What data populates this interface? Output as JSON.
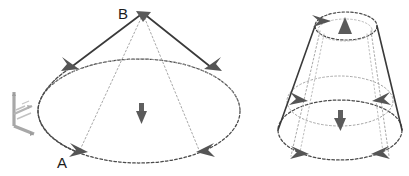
{
  "figure": {
    "background_color": "#ffffff",
    "solid_edge_color": "#3a3a3a",
    "hidden_edge_color": "#9a9a9a",
    "outline_color": "#4a4a4a",
    "arrow_color": "#555555",
    "axis_triad_color": "#9d9d9d",
    "label_color": "#1c1c1c"
  },
  "labels": {
    "apex": "B",
    "base_point": "A"
  },
  "axis_triad": {
    "name": "coordinate-triad",
    "axes": [
      "z",
      "x",
      "y"
    ]
  },
  "left_figure": {
    "name": "cone",
    "shape": "cone",
    "apex_label": "B",
    "base_label": "A",
    "center_normal_direction": "down",
    "boundary_arrow_count": 4,
    "apex_arrow_direction": "down"
  },
  "right_figure": {
    "name": "truncated-cone",
    "shape": "frustum",
    "top_normal_direction": "up",
    "bottom_normal_direction": "down",
    "boundary_arrow_count": 5
  },
  "icons": {
    "normal_arrow": "arrow-normal-icon",
    "direction_marker": "arrowhead-marker-icon",
    "axis_triad": "axis-triad-icon"
  }
}
